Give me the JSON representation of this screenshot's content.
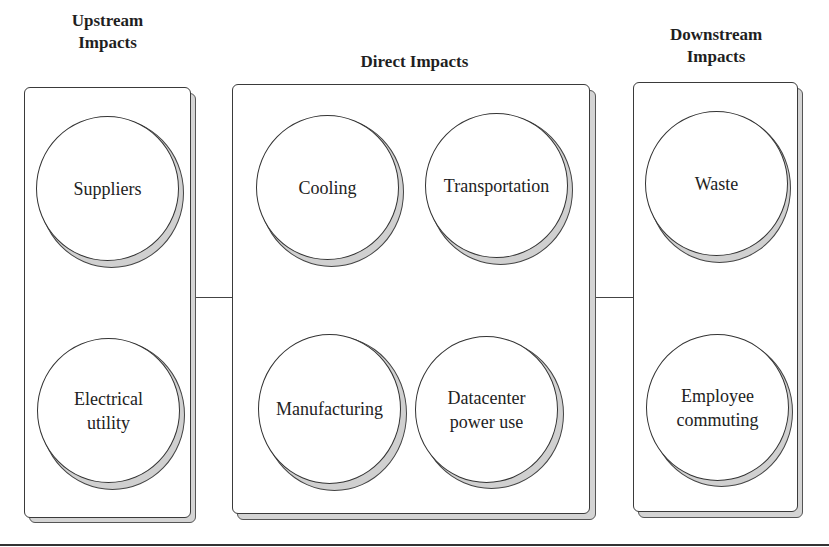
{
  "diagram": {
    "type": "grouped-circles",
    "groups": [
      {
        "id": "upstream",
        "title": "Upstream\nImpacts",
        "title_line1": "Upstream",
        "title_line2": "Impacts",
        "items": [
          {
            "label": "Suppliers"
          },
          {
            "label": "Electrical\nutility",
            "line1": "Electrical",
            "line2": "utility"
          }
        ]
      },
      {
        "id": "direct",
        "title": "Direct Impacts",
        "items": [
          {
            "label": "Cooling"
          },
          {
            "label": "Transportation"
          },
          {
            "label": "Manufacturing"
          },
          {
            "label": "Datacenter\npower use",
            "line1": "Datacenter",
            "line2": "power use"
          }
        ]
      },
      {
        "id": "downstream",
        "title": "Downstream\nImpacts",
        "title_line1": "Downstream",
        "title_line2": "Impacts",
        "items": [
          {
            "label": "Waste"
          },
          {
            "label": "Employee\ncommuting",
            "line1": "Employee",
            "line2": "commuting"
          }
        ]
      }
    ],
    "connections": [
      {
        "from": "upstream",
        "to": "direct"
      },
      {
        "from": "direct",
        "to": "downstream"
      }
    ],
    "colors": {
      "stroke": "#333333",
      "shadow": "#d0d0d0",
      "fill": "#ffffff"
    }
  }
}
